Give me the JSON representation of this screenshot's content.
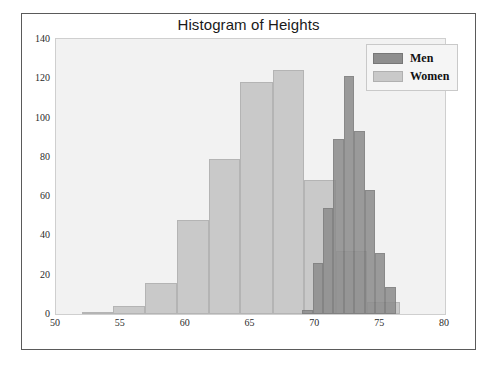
{
  "figure": {
    "title": "Histogram of Heights"
  },
  "legend": {
    "position": "upper-right",
    "entries": [
      {
        "label": "Men",
        "color": "#8e8e8e"
      },
      {
        "label": "Women",
        "color": "#c9c9c9"
      }
    ]
  },
  "axes": {
    "x": {
      "label": "",
      "min": 50,
      "max": 80,
      "ticks": [
        50,
        55,
        60,
        65,
        70,
        75,
        80
      ],
      "tick_labels": [
        "50",
        "55",
        "60",
        "65",
        "70",
        "75",
        "80"
      ]
    },
    "y": {
      "label": "",
      "min": 0,
      "max": 140,
      "ticks": [
        0,
        20,
        40,
        60,
        80,
        100,
        120,
        140
      ],
      "tick_labels": [
        "0",
        "20",
        "40",
        "60",
        "80",
        "100",
        "120",
        "140"
      ]
    },
    "grid": false
  },
  "chart_data": {
    "type": "bar",
    "title": "Histogram of Heights",
    "xlabel": "",
    "ylabel": "",
    "xlim": [
      50,
      80
    ],
    "ylim": [
      0,
      140
    ],
    "grid": false,
    "legend_position": "upper right",
    "overlap": "overlaid",
    "series": [
      {
        "name": "Women",
        "color": "#c9c9c9",
        "bin_edges": [
          52.0,
          54.4,
          56.9,
          59.3,
          61.8,
          64.2,
          66.7,
          69.1,
          71.6,
          74.0,
          76.5
        ],
        "values": [
          1,
          4,
          16,
          48,
          79,
          118,
          124,
          68,
          32,
          6
        ]
      },
      {
        "name": "Men",
        "color": "#8e8e8e",
        "bin_edges": [
          69.0,
          69.8,
          70.6,
          71.4,
          72.2,
          73.0,
          73.8,
          74.6,
          75.4,
          76.2
        ],
        "values": [
          2,
          26,
          54,
          89,
          121,
          93,
          63,
          31,
          14
        ]
      }
    ]
  }
}
